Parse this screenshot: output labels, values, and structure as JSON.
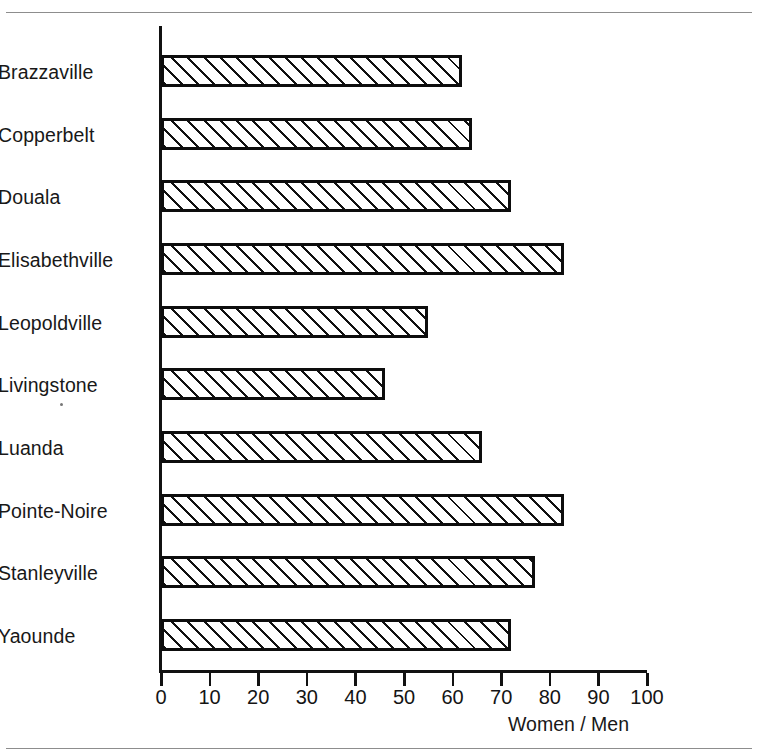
{
  "chart_data": {
    "type": "bar",
    "orientation": "horizontal",
    "title": "",
    "subtitle": "",
    "xlabel": "Women / Men",
    "ylabel": "",
    "categories": [
      "Brazzaville",
      "Copperbelt",
      "Douala",
      "Elisabethville",
      "Leopoldville",
      "Livingstone",
      "Luanda",
      "Pointe-Noire",
      "Stanleyville",
      "Yaounde"
    ],
    "values": [
      62,
      64,
      72,
      83,
      55,
      46,
      66,
      83,
      77,
      72
    ],
    "xlim": [
      0,
      100
    ],
    "xticks": [
      0,
      10,
      20,
      30,
      40,
      50,
      60,
      70,
      80,
      90,
      100
    ],
    "xtick_labels": [
      "0",
      "10",
      "20",
      "30",
      "40",
      "50",
      "60",
      "70",
      "80",
      "90",
      "100"
    ],
    "grid": false,
    "legend": null,
    "bar_fill": "diagonal-hatch",
    "bar_edge_color": "#0d0d0d",
    "bar_hatch_color": "#111111",
    "background_color": "#ffffff",
    "annotations": []
  },
  "axis": {
    "title": "Women / Men"
  },
  "frame": {
    "rule_color": "#8d8d8d"
  }
}
